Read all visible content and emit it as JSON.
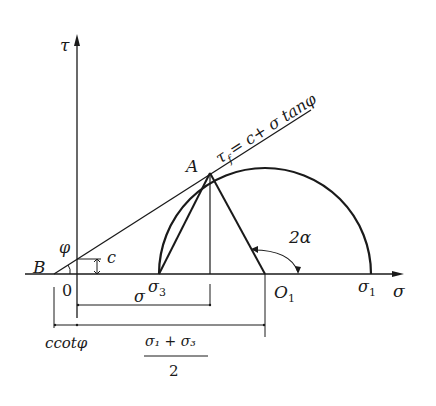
{
  "diagram": {
    "colors": {
      "line": "#1a1a1a",
      "background": "#ffffff"
    },
    "axes": {
      "y_label": "τ",
      "x_label": "σ",
      "origin_label": "0"
    },
    "envelope": {
      "equation_lhs": "τ",
      "equation_sub": "f",
      "equation_rhs": "= c+ σ tanφ"
    },
    "points": {
      "A": "A",
      "B": "B",
      "O1": "O",
      "O1_sub": "1",
      "sigma1": "σ",
      "sigma1_sub": "1",
      "sigma3": "σ",
      "sigma3_sub": "3"
    },
    "annotations": {
      "phi": "φ",
      "c": "c",
      "two_alpha": "2α",
      "sigma_dim": "σ",
      "ccot_phi": "ccotφ",
      "mean_stress_numerator": "σ₁ + σ₃",
      "mean_stress_denominator": "2"
    }
  }
}
